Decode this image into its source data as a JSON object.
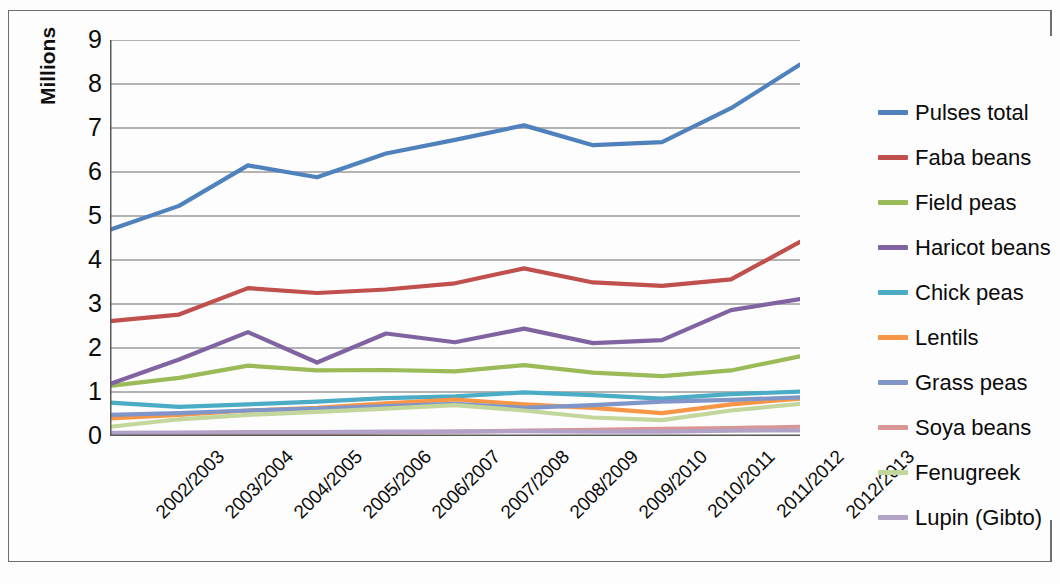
{
  "chart_data": {
    "type": "line",
    "title": "",
    "subtitle": "",
    "xlabel": "",
    "ylabel": "Millions",
    "ylim": [
      0,
      9
    ],
    "ytick_labels": [
      "0",
      "1",
      "2",
      "3",
      "4",
      "5",
      "6",
      "7",
      "8",
      "9"
    ],
    "ytick_values": [
      0,
      1,
      2,
      3,
      4,
      5,
      6,
      7,
      8,
      9
    ],
    "grid": true,
    "grid_axis": "y",
    "legend_position": "right",
    "categories": [
      "2002/2003",
      "2003/2004",
      "2004/2005",
      "2005/2006",
      "2006/2007",
      "2007/2008",
      "2008/2009",
      "2009/2010",
      "2010/2011",
      "2011/2012",
      "2012/2013"
    ],
    "series": [
      {
        "name": "Pulses total",
        "color": "#4F81BD",
        "values": [
          4.69,
          5.23,
          6.15,
          5.88,
          6.42,
          6.73,
          7.06,
          6.61,
          6.68,
          7.45,
          8.44
        ]
      },
      {
        "name": "Faba beans",
        "color": "#C0504D",
        "values": [
          2.61,
          2.76,
          3.36,
          3.25,
          3.33,
          3.47,
          3.81,
          3.49,
          3.41,
          3.56,
          4.41
        ]
      },
      {
        "name": "Field peas",
        "color": "#9BBB59",
        "values": [
          1.14,
          1.32,
          1.6,
          1.49,
          1.5,
          1.47,
          1.61,
          1.44,
          1.36,
          1.49,
          1.81
        ]
      },
      {
        "name": "Haricot beans",
        "color": "#8064A2",
        "values": [
          1.18,
          1.74,
          2.36,
          1.67,
          2.33,
          2.13,
          2.44,
          2.11,
          2.18,
          2.86,
          3.11
        ]
      },
      {
        "name": "Chick peas",
        "color": "#4BACC6",
        "values": [
          0.76,
          0.66,
          0.72,
          0.78,
          0.86,
          0.9,
          0.99,
          0.93,
          0.85,
          0.95,
          1.01
        ]
      },
      {
        "name": "Lentils",
        "color": "#F79646",
        "values": [
          0.4,
          0.48,
          0.58,
          0.64,
          0.74,
          0.83,
          0.72,
          0.64,
          0.52,
          0.72,
          0.85
        ]
      },
      {
        "name": "Grass peas",
        "color": "#8096C8",
        "values": [
          0.48,
          0.52,
          0.58,
          0.62,
          0.68,
          0.73,
          0.64,
          0.7,
          0.78,
          0.82,
          0.88
        ]
      },
      {
        "name": "Soya beans",
        "color": "#D99694",
        "values": [
          0.03,
          0.04,
          0.05,
          0.06,
          0.08,
          0.1,
          0.12,
          0.14,
          0.16,
          0.18,
          0.21
        ]
      },
      {
        "name": "Fenugreek",
        "color": "#C3D69B",
        "values": [
          0.21,
          0.38,
          0.48,
          0.55,
          0.62,
          0.7,
          0.58,
          0.42,
          0.36,
          0.58,
          0.73
        ]
      },
      {
        "name": "Lupin (Gibto)",
        "color": "#B3A2C7",
        "values": [
          0.07,
          0.08,
          0.09,
          0.09,
          0.1,
          0.1,
          0.11,
          0.1,
          0.1,
          0.12,
          0.13
        ]
      }
    ]
  },
  "legend": {
    "items": [
      "Pulses total",
      "Faba beans",
      "Field peas",
      "Haricot beans",
      "Chick peas",
      "Lentils",
      "Grass peas",
      "Soya beans",
      "Fenugreek",
      "Lupin (Gibto)"
    ]
  }
}
